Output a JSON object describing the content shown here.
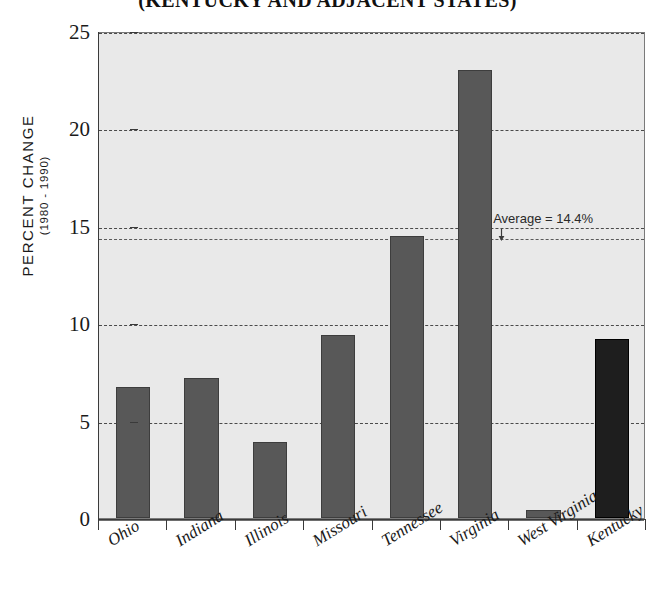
{
  "chart_data": {
    "type": "bar",
    "title": "(KENTUCKY AND ADJACENT STATES)",
    "xlabel": "",
    "ylabel": "PERCENT CHANGE",
    "ylabel_sub": "(1980 - 1990)",
    "categories": [
      "Ohio",
      "Indiana",
      "Illinois",
      "Missouri",
      "Tennessee",
      "Virginia",
      "West Virginia",
      "Kentucky"
    ],
    "values": [
      6.7,
      7.2,
      3.9,
      9.4,
      14.5,
      23.0,
      0.4,
      9.2
    ],
    "ylim": [
      0,
      25
    ],
    "yticks": [
      0,
      5,
      10,
      15,
      20,
      25
    ],
    "ytick_labels": [
      "0",
      "5",
      "10",
      "15",
      "20",
      "25"
    ],
    "grid": true,
    "legend": "none",
    "highlight_category": "Kentucky",
    "reference_line": {
      "label": "U.S. Average = 14.4%",
      "value": 14.4
    },
    "colors": {
      "bar": "#585858",
      "bar_highlight": "#1e1e1e",
      "panel_background": "#e9e9e9",
      "grid": "#4a4a4a",
      "axis": "#3a3a3a",
      "text": "#1a1a1a"
    }
  }
}
